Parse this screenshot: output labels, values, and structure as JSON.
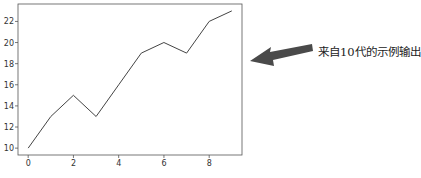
{
  "chart_data": {
    "type": "line",
    "title": "",
    "xlabel": "",
    "ylabel": "",
    "x": [
      0,
      1,
      2,
      3,
      4,
      5,
      6,
      7,
      8,
      9
    ],
    "series": [
      {
        "name": "generation output",
        "values": [
          10,
          13,
          15,
          13,
          16,
          19,
          20,
          19,
          22,
          23
        ]
      }
    ],
    "xticks": [
      0,
      2,
      4,
      6,
      8
    ],
    "yticks": [
      10,
      12,
      14,
      16,
      18,
      20,
      22
    ],
    "xlim": [
      -0.45,
      9.45
    ],
    "ylim": [
      9.35,
      23.65
    ],
    "grid": false,
    "line_color": "#444444"
  },
  "annotation": {
    "text": "来自10代的示例输出",
    "arrow": "left-pointing-arrow"
  }
}
